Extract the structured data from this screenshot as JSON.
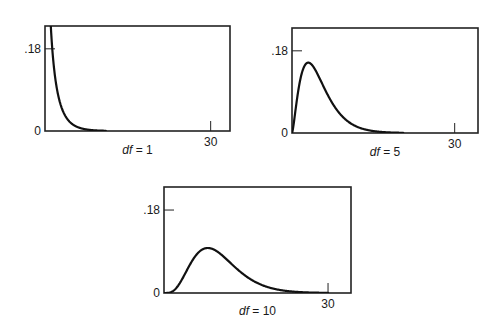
{
  "chart_data": [
    {
      "type": "line",
      "title": "",
      "caption": {
        "var": "df",
        "eq": " = 1"
      },
      "df": 1,
      "series": [
        {
          "name": "chi-square density, df = 1",
          "function": "chi2_pdf",
          "df": 1,
          "x_range": [
            0.02,
            11
          ]
        }
      ],
      "xlabel": "",
      "ylabel": "",
      "xlim": [
        0,
        33.5
      ],
      "ylim": [
        0,
        0.23
      ],
      "xticks": [
        {
          "value": 30,
          "label": "30"
        }
      ],
      "yticks": [
        {
          "value": 0,
          "label": "0"
        },
        {
          "value": 0.18,
          "label": ".18"
        }
      ],
      "grid": false,
      "color": "#111111"
    },
    {
      "type": "line",
      "title": "",
      "caption": {
        "var": "df",
        "eq": " = 5"
      },
      "df": 5,
      "series": [
        {
          "name": "chi-square density, df = 5",
          "function": "chi2_pdf",
          "df": 5,
          "x_range": [
            0,
            20.5
          ]
        }
      ],
      "xlabel": "",
      "ylabel": "",
      "xlim": [
        0,
        34.3
      ],
      "ylim": [
        0,
        0.23
      ],
      "xticks": [
        {
          "value": 30,
          "label": "30"
        }
      ],
      "yticks": [
        {
          "value": 0,
          "label": "0"
        },
        {
          "value": 0.18,
          "label": ".18"
        }
      ],
      "grid": false,
      "peak": {
        "x": 3,
        "y": 0.154
      },
      "color": "#111111"
    },
    {
      "type": "line",
      "title": "",
      "caption": {
        "var": "df",
        "eq": " = 10"
      },
      "df": 10,
      "series": [
        {
          "name": "chi-square density, df = 10",
          "function": "chi2_pdf",
          "df": 10,
          "x_range": [
            0,
            30
          ]
        }
      ],
      "xlabel": "",
      "ylabel": "",
      "xlim": [
        0,
        34.2
      ],
      "ylim": [
        0,
        0.23
      ],
      "xticks": [
        {
          "value": 30,
          "label": "30"
        }
      ],
      "yticks": [
        {
          "value": 0,
          "label": "0"
        },
        {
          "value": 0.18,
          "label": ".18"
        }
      ],
      "grid": false,
      "peak": {
        "x": 8,
        "y": 0.0975
      },
      "color": "#111111"
    }
  ]
}
